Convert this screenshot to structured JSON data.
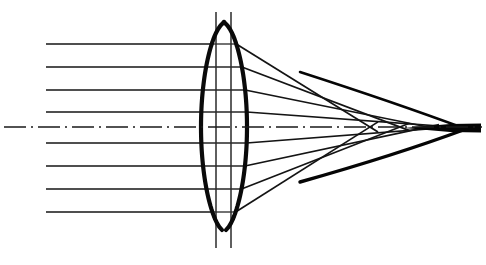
{
  "figure": {
    "background_color": "#ffffff",
    "ink_color": "#0a0a0a",
    "width": 486,
    "height": 265
  },
  "optical_axis": {
    "name": "optical-axis",
    "y": 127,
    "x_start": 4,
    "x_end": 482,
    "style": "dash-dot",
    "dash_pattern": "22 5 2 5",
    "stroke_width": 1.6,
    "color": "#1a1a1a"
  },
  "lens": {
    "name": "biconvex-lens",
    "type": "biconvex",
    "center_x": 224,
    "top_vertex_y": 22,
    "bottom_vertex_y": 230,
    "left_edge_x": 201,
    "right_edge_x": 247,
    "equator_y": 127,
    "stroke_width": 4.2,
    "color": "#0a0a0a"
  },
  "aperture_lines": [
    {
      "name": "aperture-line-left",
      "x": 216,
      "y_top": 12,
      "y_bottom": 248,
      "stroke_width": 1.5
    },
    {
      "name": "aperture-line-right",
      "x": 231,
      "y_top": 12,
      "y_bottom": 248,
      "stroke_width": 1.5
    }
  ],
  "incident_rays": {
    "name": "incident-parallel-rays",
    "x_start": 46,
    "count": 8,
    "stroke_width": 1.7,
    "heights": [
      44,
      67,
      90,
      112,
      143,
      166,
      189,
      212
    ],
    "labels": [
      "ray-1-top",
      "ray-2",
      "ray-3",
      "ray-4",
      "ray-5",
      "ray-6",
      "ray-7",
      "ray-8-bottom"
    ]
  },
  "refracted_rays": {
    "name": "refracted-converging-rays",
    "stroke_width": 1.7,
    "focus_note": "Marginal rays cross the axis nearer the lens than paraxial rays (spherical aberration).",
    "rays": [
      {
        "label": "refracted-1-top",
        "enter_y": 44,
        "exit_x": 236,
        "exit_y": 44,
        "cross_x": 370,
        "cross_y": 127
      },
      {
        "label": "refracted-2",
        "enter_y": 67,
        "exit_x": 242,
        "exit_y": 67,
        "cross_x": 400,
        "cross_y": 127
      },
      {
        "label": "refracted-3",
        "enter_y": 90,
        "exit_x": 245,
        "exit_y": 90,
        "cross_x": 428,
        "cross_y": 127
      },
      {
        "label": "refracted-4",
        "enter_y": 112,
        "exit_x": 247,
        "exit_y": 112,
        "cross_x": 452,
        "cross_y": 127
      },
      {
        "label": "refracted-5",
        "enter_y": 143,
        "exit_x": 247,
        "exit_y": 143,
        "cross_x": 452,
        "cross_y": 127
      },
      {
        "label": "refracted-6",
        "enter_y": 166,
        "exit_x": 245,
        "exit_y": 166,
        "cross_x": 428,
        "cross_y": 127
      },
      {
        "label": "refracted-7",
        "enter_y": 189,
        "exit_x": 242,
        "exit_y": 189,
        "cross_x": 400,
        "cross_y": 127
      },
      {
        "label": "refracted-8-bottom",
        "enter_y": 212,
        "exit_x": 236,
        "exit_y": 212,
        "cross_x": 370,
        "cross_y": 127
      }
    ]
  },
  "caustic": {
    "name": "caustic-envelope",
    "stroke_width": 3.4,
    "apex_x": 466,
    "apex_y": 129,
    "upper_start_x": 300,
    "upper_start_y": 72,
    "lower_start_x": 300,
    "lower_start_y": 182,
    "description": "Thick envelope formed by the family of refracted rays; terminates in a bright focal spike on the axis."
  },
  "focal_spike": {
    "name": "focal-spike",
    "x_start": 404,
    "x_end": 481,
    "y": 128,
    "max_thickness": 9
  }
}
